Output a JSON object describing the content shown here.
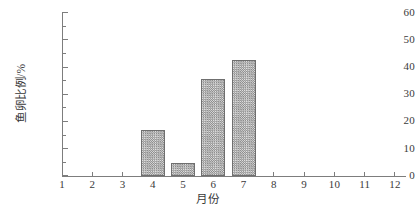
{
  "chart_data": {
    "type": "bar",
    "title": "",
    "xlabel": "月份",
    "ylabel": "鱼卵比例/%",
    "categories": [
      "1",
      "2",
      "3",
      "4",
      "5",
      "6",
      "7",
      "8",
      "9",
      "10",
      "11",
      "12"
    ],
    "values": [
      0,
      0,
      0,
      16.9,
      4.8,
      35.5,
      42.7,
      0,
      0,
      0,
      0,
      0
    ],
    "series": [
      {
        "name": "鱼卵比例",
        "values": [
          0,
          0,
          0,
          16.9,
          4.8,
          35.5,
          42.7,
          0,
          0,
          0,
          0,
          0
        ]
      }
    ],
    "xlim": [
      0.5,
      12.3
    ],
    "ylim": [
      0,
      60
    ],
    "y_ticks": [
      0,
      10,
      20,
      30,
      40,
      50,
      60
    ],
    "y_tick_labels": [
      "0",
      "10",
      "20",
      "30",
      "40",
      "50",
      "60"
    ],
    "y_minor_ticks": [
      5,
      15,
      25,
      35,
      45,
      55
    ],
    "x_ticks": [
      1,
      2,
      3,
      4,
      5,
      6,
      7,
      8,
      9,
      10,
      11,
      12
    ],
    "x_tick_labels": [
      "1",
      "2",
      "3",
      "4",
      "5",
      "6",
      "7",
      "8",
      "9",
      "10",
      "11",
      "12"
    ],
    "grid": false,
    "legend": false,
    "legend_position": "none",
    "bar_fill": "checkerboard-hatch",
    "bar_edge_color": "#6f6f6f",
    "bar_fill_color": "#b9b9b9",
    "axis_color": "#7d7d7d",
    "text_color": "#3a3a3a",
    "background_color": "#ffffff"
  }
}
